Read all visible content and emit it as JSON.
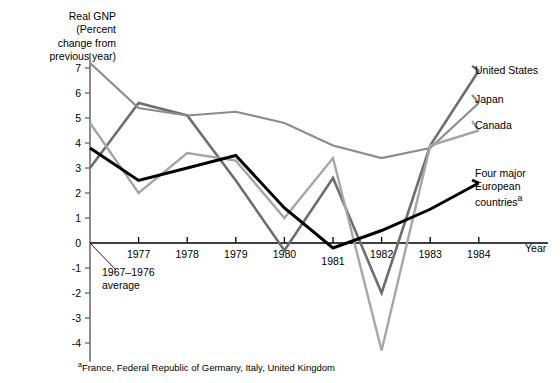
{
  "chart_data": {
    "type": "line",
    "title": "Real GNP\n(Percent\nchange from\nprevious year)",
    "xlabel": "Year",
    "ylabel": "Real GNP (Percent change from previous year)",
    "x": [
      "1967-1976 average",
      "1977",
      "1978",
      "1979",
      "1980",
      "1981",
      "1982",
      "1983",
      "1984"
    ],
    "xtick_labels": [
      "1977",
      "1978",
      "1979",
      "1980",
      "1981",
      "1982",
      "1983",
      "1984"
    ],
    "ytick_labels": [
      "7",
      "6",
      "5",
      "4",
      "3",
      "2",
      "1",
      "0",
      "-1",
      "-2",
      "-3",
      "-4"
    ],
    "ylim": [
      -4.6,
      7.6
    ],
    "yticks": [
      7,
      6,
      5,
      4,
      3,
      2,
      1,
      0,
      -1,
      -2,
      -3,
      -4
    ],
    "grid": false,
    "legend_position": "right-inline",
    "series": [
      {
        "name": "United States",
        "color": "#6e6e6e",
        "width": 2.6,
        "values": [
          3.0,
          5.6,
          5.1,
          2.5,
          -0.3,
          2.6,
          -2.0,
          3.9,
          6.9
        ]
      },
      {
        "name": "Japan",
        "color": "#8c8c8c",
        "width": 2.2,
        "values": [
          7.2,
          5.4,
          5.1,
          5.25,
          4.8,
          3.9,
          3.4,
          3.8,
          5.6
        ]
      },
      {
        "name": "Canada",
        "color": "#a6a6a6",
        "width": 2.4,
        "values": [
          4.8,
          2.0,
          3.6,
          3.3,
          1.0,
          3.4,
          -4.3,
          3.9,
          4.5
        ]
      },
      {
        "name": "Four major European countries",
        "color": "#000000",
        "width": 3.0,
        "has_footnote": true,
        "values": [
          3.8,
          2.5,
          3.0,
          3.5,
          1.4,
          -0.2,
          0.5,
          1.35,
          2.4
        ]
      }
    ],
    "annotations": [
      {
        "name": "baseline-average",
        "text": "1967–1976\naverage"
      }
    ],
    "footnote": "France, Federal Republic of Germany, Italy, United Kingdom",
    "footnote_marker": "a"
  },
  "labels": {
    "united_states": "United States",
    "japan": "Japan",
    "canada": "Canada",
    "four_major_european": "Four major\nEuropean\ncountries",
    "four_major_marker": "a",
    "year_axis": "Year",
    "baseline_note": "1967–1976\naverage"
  }
}
